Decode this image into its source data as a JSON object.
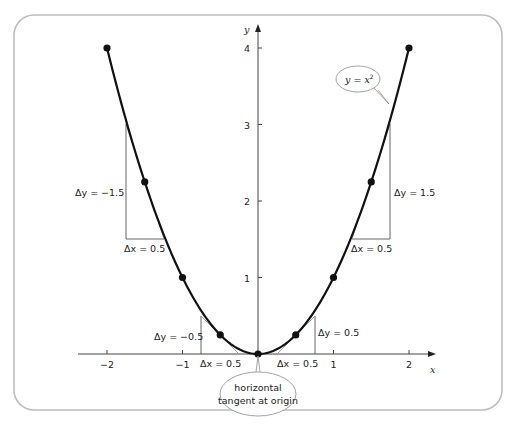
{
  "figure": {
    "frame_color": "#bdbdbd",
    "curve_color": "#111111",
    "tangent_color": "#888888"
  },
  "axes": {
    "x_label": "x",
    "y_label": "y",
    "x_ticks": [
      {
        "value": -2,
        "label": "−2"
      },
      {
        "value": -1,
        "label": "−1"
      },
      {
        "value": 1,
        "label": "1"
      },
      {
        "value": 2,
        "label": "2"
      }
    ],
    "y_ticks": [
      {
        "value": 1,
        "label": "1"
      },
      {
        "value": 2,
        "label": "2"
      },
      {
        "value": 3,
        "label": "3"
      },
      {
        "value": 4,
        "label": "4"
      }
    ]
  },
  "annotations": {
    "curve_label_y": "y",
    "curve_label_eq": " = ",
    "curve_label_x": "x",
    "curve_label_exp": "2",
    "origin_callout_line1": "horizontal",
    "origin_callout_line2": "tangent at origin",
    "left_big_dy": "Δy = −1.5",
    "left_big_dx": "Δx = 0.5",
    "right_big_dy": "Δy = 1.5",
    "right_big_dx": "Δx = 0.5",
    "left_small_dy": "Δy = −0.5",
    "left_small_dx": "Δx = 0.5",
    "right_small_dy": "Δy = 0.5",
    "right_small_dx": "Δx = 0.5"
  },
  "chart_data": {
    "type": "line",
    "title": "",
    "function": "y = x^2",
    "xlabel": "x",
    "ylabel": "y",
    "xlim": [
      -2,
      2
    ],
    "ylim": [
      0,
      4
    ],
    "points": [
      {
        "x": -2,
        "y": 4
      },
      {
        "x": -1.5,
        "y": 2.25
      },
      {
        "x": -1,
        "y": 1
      },
      {
        "x": -0.5,
        "y": 0.25
      },
      {
        "x": 0,
        "y": 0
      },
      {
        "x": 0.5,
        "y": 0.25
      },
      {
        "x": 1,
        "y": 1
      },
      {
        "x": 1.5,
        "y": 2.25
      },
      {
        "x": 2,
        "y": 4
      }
    ],
    "tangent_triangles": [
      {
        "at_x": -1.5,
        "dx": 0.5,
        "dy": -1.5
      },
      {
        "at_x": -0.5,
        "dx": 0.5,
        "dy": -0.5
      },
      {
        "at_x": 0.5,
        "dx": 0.5,
        "dy": 0.5
      },
      {
        "at_x": 1.5,
        "dx": 0.5,
        "dy": 1.5
      }
    ],
    "annotations": [
      "y = x^2",
      "horizontal tangent at origin"
    ],
    "grid": false
  }
}
